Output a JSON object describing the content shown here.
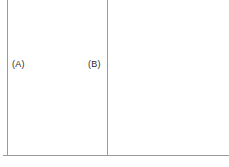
{
  "figure": {
    "background_color": "#ffffff",
    "line_color": "#9a9a9a",
    "text_color": "#2b2b2b",
    "labels": [
      {
        "id": "a",
        "text": "(A)"
      },
      {
        "id": "b",
        "text": "(B)"
      }
    ],
    "lines": [
      {
        "id": "left-vertical",
        "orientation": "vertical",
        "x": 7,
        "y_start": 0,
        "y_end": 156
      },
      {
        "id": "middle-vertical",
        "orientation": "vertical",
        "x": 107,
        "y_start": 0,
        "y_end": 156
      },
      {
        "id": "baseline",
        "orientation": "horizontal",
        "y": 155,
        "x_start": 3,
        "x_end": 229
      }
    ]
  }
}
